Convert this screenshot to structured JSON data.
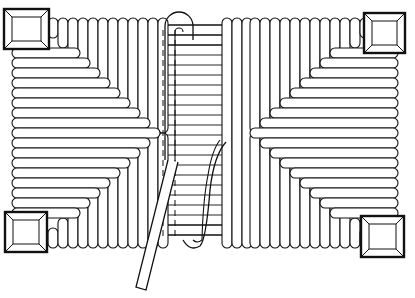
{
  "figure": {
    "title": "Rush seat weaving pattern",
    "width": 415,
    "height": 298,
    "colors": {
      "ink": "#111111",
      "paper": "#ffffff"
    },
    "corner_posts": [
      {
        "name": "top-left",
        "x": 4,
        "y": 9,
        "w": 45,
        "h": 40
      },
      {
        "name": "top-right",
        "x": 364,
        "y": 13,
        "w": 41,
        "h": 40
      },
      {
        "name": "bottom-left",
        "x": 5,
        "y": 212,
        "w": 42,
        "h": 40
      },
      {
        "name": "bottom-right",
        "x": 361,
        "y": 216,
        "w": 43,
        "h": 41
      }
    ],
    "seat": {
      "left": 12,
      "right": 398,
      "top": 18,
      "bottom": 248
    },
    "center_gap": {
      "left": 181,
      "right": 222
    },
    "strand_pitch": 10,
    "working_strand": {
      "loop_top": 12,
      "loop_left": 165,
      "loop_right": 193,
      "tail_end": [
        135,
        288
      ]
    }
  }
}
